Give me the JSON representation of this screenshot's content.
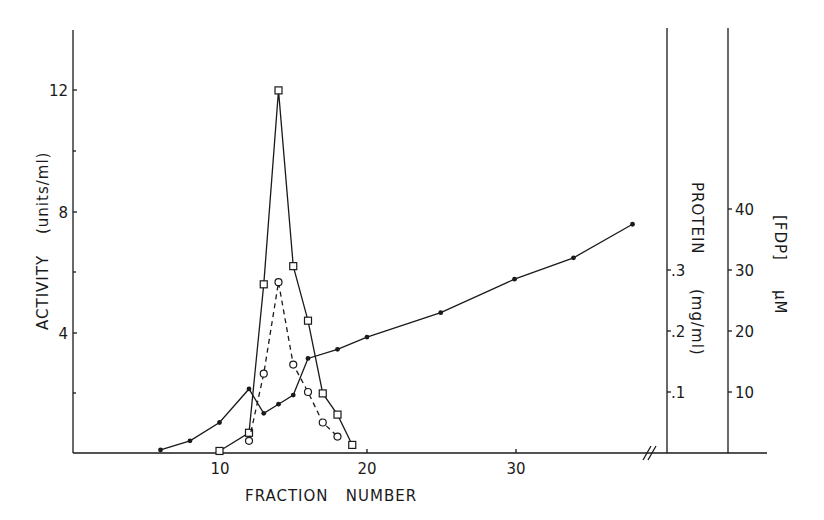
{
  "chart_data": {
    "type": "line",
    "title": "",
    "xlabel": "FRACTION NUMBER",
    "x_ticks": [
      10,
      20,
      30
    ],
    "xlim": [
      0,
      40
    ],
    "axis_break": "x-axis break (//) before right-hand axes",
    "axes": {
      "left": {
        "label": "ACTIVITY (units/ml)",
        "ticks": [
          4,
          8,
          12
        ],
        "ylim": [
          0,
          14
        ]
      },
      "right_inner": {
        "label": "PROTEIN (mg/ml)",
        "ticks": [
          ".1",
          ".2",
          ".3"
        ],
        "ylim": [
          0,
          0.6
        ]
      },
      "right_outer": {
        "label": "[FDP] µM",
        "ticks": [
          10,
          20,
          30,
          40
        ],
        "ylim": [
          0,
          60
        ]
      }
    },
    "series": [
      {
        "name": "Activity",
        "axis": "left",
        "marker": "open-square",
        "line": "solid",
        "x": [
          10,
          12,
          13,
          14,
          15,
          16,
          17,
          18,
          19
        ],
        "values": [
          0.1,
          0.7,
          5.6,
          12.0,
          6.2,
          4.4,
          2.0,
          1.3,
          0.3
        ]
      },
      {
        "name": "Protein",
        "axis": "right_inner",
        "marker": "open-circle",
        "line": "dashed",
        "x": [
          12,
          13,
          14,
          15,
          16,
          17,
          18
        ],
        "values": [
          0.02,
          0.13,
          0.28,
          0.145,
          0.1,
          0.05,
          0.027
        ]
      },
      {
        "name": "[FDP]",
        "axis": "right_outer",
        "marker": "filled-dot",
        "line": "solid",
        "x": [
          6,
          8,
          10,
          12,
          13,
          14,
          15,
          16,
          18,
          20,
          25,
          30,
          34,
          38
        ],
        "values": [
          0.5,
          2,
          5,
          10.5,
          6.5,
          8,
          9.5,
          15.5,
          17,
          19,
          23,
          28.5,
          32,
          37.5
        ]
      }
    ],
    "grid": false,
    "legend": "none"
  },
  "labels": {
    "left_y_main": "ACTIVITY",
    "left_y_unit": "(units/ml)",
    "x_axis": "FRACTION   NUMBER",
    "protein_main": "PROTEIN",
    "protein_unit": "(mg/ml)",
    "fdp_main": "[FDP]",
    "fdp_unit": "µM",
    "x_tick_10": "10",
    "x_tick_20": "20",
    "x_tick_30": "30",
    "y_tick_4": "4",
    "y_tick_8": "8",
    "y_tick_12": "12",
    "p_tick_1": ".1",
    "p_tick_2": ".2",
    "p_tick_3": ".3",
    "f_tick_10": "10",
    "f_tick_20": "20",
    "f_tick_30": "30",
    "f_tick_40": "40"
  },
  "colors": {
    "ink": "#1a1a1a",
    "background": "#ffffff"
  }
}
